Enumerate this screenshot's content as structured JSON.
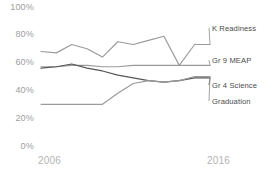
{
  "chart_data": {
    "type": "line",
    "title": "",
    "xlabel": "",
    "ylabel": "",
    "ylim": [
      0,
      100
    ],
    "xlim": [
      2006,
      2017
    ],
    "grid": false,
    "legend_position": "right-inline",
    "ytick_labels": [
      "100%",
      "80%",
      "60%",
      "40%",
      "20%",
      "0%"
    ],
    "ytick_values": [
      100,
      80,
      60,
      40,
      20,
      0
    ],
    "xtick_labels": [
      "2006",
      "2016"
    ],
    "xtick_values": [
      2006,
      2016
    ],
    "x": [
      2006,
      2007,
      2008,
      2009,
      2010,
      2011,
      2012,
      2013,
      2014,
      2015,
      2016,
      2017
    ],
    "series": [
      {
        "name": "K Readiness",
        "color": "#9a9a9a",
        "values": [
          68,
          67,
          73,
          70,
          64,
          75,
          73,
          76,
          79,
          58,
          73,
          73
        ]
      },
      {
        "name": "Gr 9 MEAP",
        "color": "#9a9a9a",
        "values": [
          57,
          57,
          58,
          58,
          57,
          57,
          58,
          58,
          58,
          58,
          58,
          58
        ]
      },
      {
        "name": "Gr 4 Science",
        "color": "#555555",
        "values": [
          56,
          57,
          59,
          56,
          54,
          51,
          49,
          47,
          46,
          47,
          49,
          49
        ]
      },
      {
        "name": "Graduation",
        "color": "#9a9a9a",
        "values": [
          30,
          30,
          30,
          30,
          30,
          38,
          45,
          47,
          46,
          47,
          50,
          50
        ]
      }
    ]
  }
}
